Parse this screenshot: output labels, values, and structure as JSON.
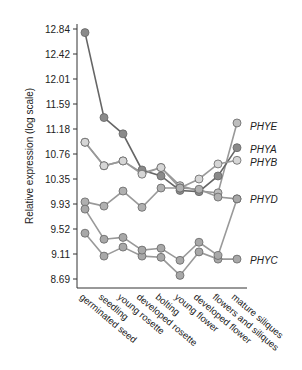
{
  "chart_data": {
    "type": "line",
    "title": "",
    "xlabel": "",
    "ylabel": "Relative expression (log scale)",
    "y_ticks": [
      "12.84",
      "12.42",
      "12.01",
      "11.59",
      "11.18",
      "10.76",
      "10.35",
      "9.93",
      "9.52",
      "9.11",
      "8.69"
    ],
    "ylim": [
      8.69,
      12.84
    ],
    "grid": false,
    "categories": [
      "germinated seed",
      "seedling",
      "young rosette",
      "developed rosette",
      "bolting",
      "young flower",
      "developed flower",
      "flowers and siliques",
      "mature siliques"
    ],
    "series": [
      {
        "name": "PHYE",
        "color": "#bdbdbd",
        "values": [
          10.96,
          10.57,
          10.65,
          10.45,
          10.54,
          10.24,
          10.15,
          10.12,
          11.28
        ]
      },
      {
        "name": "PHYA",
        "color": "#8a8a8a",
        "values": [
          12.78,
          11.37,
          11.1,
          10.5,
          10.4,
          10.16,
          10.14,
          10.4,
          10.87
        ]
      },
      {
        "name": "PHYB",
        "color": "#d6d6d6",
        "values": [
          10.96,
          10.57,
          10.65,
          10.43,
          10.54,
          10.2,
          10.35,
          10.6,
          10.66
        ]
      },
      {
        "name": "PHYD",
        "color": "#b0b0b0",
        "values": [
          9.97,
          9.9,
          10.15,
          9.88,
          10.2,
          10.2,
          10.18,
          10.05,
          10.02
        ]
      },
      {
        "name": "PHYC",
        "color": "#a8a8a8",
        "values": [
          9.45,
          9.07,
          9.22,
          9.07,
          9.05,
          8.75,
          9.14,
          9.02,
          9.02
        ]
      },
      {
        "name": "PHYC-b",
        "color": "#a8a8a8",
        "values": [
          9.85,
          9.35,
          9.38,
          9.17,
          9.2,
          9.0,
          9.3,
          9.08,
          10.02
        ]
      }
    ],
    "legend_position": "right, inline labels"
  },
  "labels": {
    "ylabel": "Relative expression (log scale)",
    "phye": "PHYE",
    "phya": "PHYA",
    "phyb": "PHYB",
    "phyd": "PHYD",
    "phyc": "PHYC"
  }
}
